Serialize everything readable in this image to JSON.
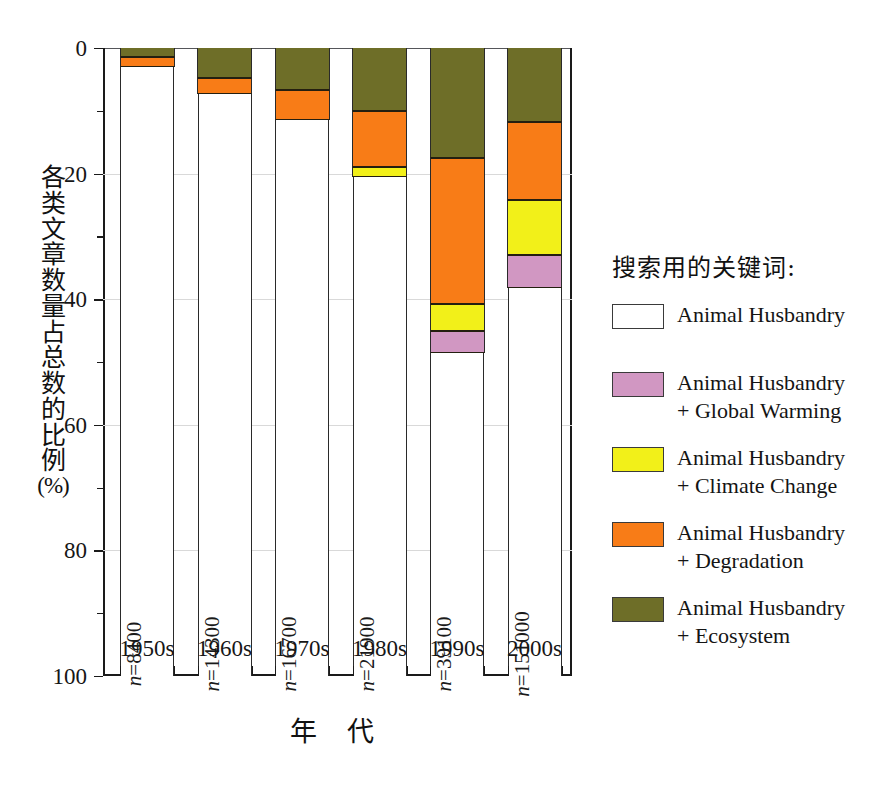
{
  "chart_data": {
    "type": "bar",
    "subtype": "stacked-percentage-column",
    "title": "",
    "xlabel": "年 代",
    "ylabel": "各类文章数量占总数的比例 (%)",
    "ylabel_chars": [
      "各",
      "类",
      "文",
      "章",
      "数",
      "量",
      "占",
      "总",
      "数",
      "的",
      "比",
      "例"
    ],
    "ylabel_unit": "(%)",
    "ylim": [
      0,
      100
    ],
    "y_inverted": true,
    "ytick_labels": [
      "0",
      "20",
      "40",
      "60",
      "80",
      "100"
    ],
    "ytick_values": [
      0,
      20,
      40,
      60,
      80,
      100
    ],
    "yminor_values": [
      10,
      30,
      50,
      70,
      90
    ],
    "grid": "horizontal-light",
    "legend_position": "right",
    "categories": [
      "1950s",
      "1960s",
      "1970s",
      "1980s",
      "1990s",
      "2000s"
    ],
    "sample_sizes": [
      "n=8400",
      "n=14300",
      "n=16700",
      "n=21900",
      "n=39100",
      "n=151000"
    ],
    "sample_size_values": [
      8400,
      14300,
      16700,
      21900,
      39100,
      151000
    ],
    "series": [
      {
        "name": "Animal Husbandry + Ecosystem",
        "color": "#6E6E28",
        "values": [
          1.5,
          4.8,
          6.7,
          10.0,
          17.5,
          11.8
        ]
      },
      {
        "name": "Animal Husbandry + Degradation",
        "color": "#F87C17",
        "values": [
          1.5,
          2.5,
          4.8,
          9.0,
          23.3,
          12.4
        ]
      },
      {
        "name": "Animal Husbandry + Climate Change",
        "color": "#F2F019",
        "values": [
          0.0,
          0.0,
          0.0,
          1.5,
          4.2,
          8.8
        ]
      },
      {
        "name": "Animal Husbandry + Global Warming",
        "color": "#D197C2",
        "values": [
          0.0,
          0.0,
          0.0,
          0.0,
          3.5,
          5.2
        ]
      },
      {
        "name": "Animal Husbandry",
        "color": "#FFFFFF",
        "values": [
          97.0,
          92.7,
          88.5,
          79.5,
          51.5,
          61.8
        ]
      }
    ],
    "cumulative_tops": [
      {
        "category": "1950s",
        "ecosystem": 1.5,
        "degradation": 3.0,
        "climate": 3.0,
        "warming": 3.0
      },
      {
        "category": "1960s",
        "ecosystem": 4.8,
        "degradation": 7.3,
        "climate": 7.3,
        "warming": 7.3
      },
      {
        "category": "1970s",
        "ecosystem": 6.7,
        "degradation": 11.5,
        "climate": 11.5,
        "warming": 11.5
      },
      {
        "category": "1980s",
        "ecosystem": 10.0,
        "degradation": 19.0,
        "climate": 20.5,
        "warming": 20.5
      },
      {
        "category": "1990s",
        "ecosystem": 17.5,
        "degradation": 40.8,
        "climate": 45.0,
        "warming": 48.5
      },
      {
        "category": "2000s",
        "ecosystem": 11.8,
        "degradation": 24.2,
        "climate": 33.0,
        "warming": 38.2
      }
    ]
  },
  "legend": {
    "title": "搜索用的关键词:",
    "items": [
      {
        "label": "Animal Husbandry",
        "color": "#FFFFFF",
        "icon": "legend-swatch-animal-husbandry"
      },
      {
        "label": "Animal Husbandry\n+ Global Warming",
        "color": "#D197C2",
        "icon": "legend-swatch-global-warming"
      },
      {
        "label": "Animal Husbandry\n+ Climate Change",
        "color": "#F2F019",
        "icon": "legend-swatch-climate-change"
      },
      {
        "label": "Animal Husbandry\n+  Degradation",
        "color": "#F87C17",
        "icon": "legend-swatch-degradation"
      },
      {
        "label": "Animal Husbandry\n+  Ecosystem",
        "color": "#6E6E28",
        "icon": "legend-swatch-ecosystem"
      }
    ]
  }
}
